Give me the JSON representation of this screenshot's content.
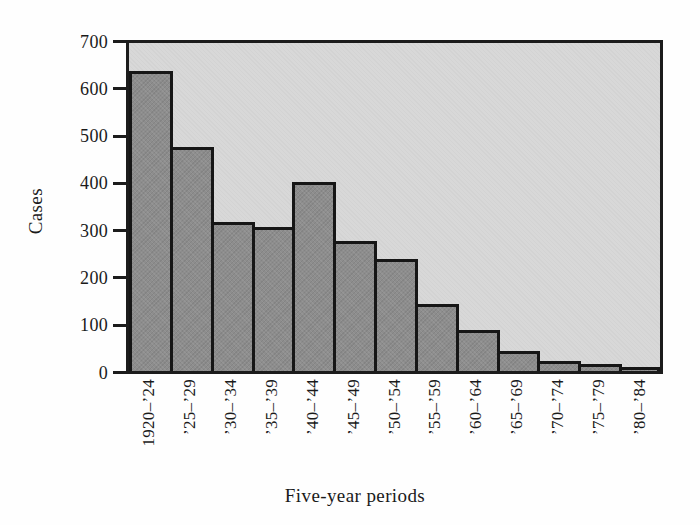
{
  "figure": {
    "y_axis_title": "Cases",
    "x_axis_title": "Five-year periods"
  },
  "chart_data": {
    "type": "bar",
    "title": "",
    "xlabel": "Five-year periods",
    "ylabel": "Cases",
    "categories": [
      "1920–’24",
      "’25–’29",
      "’30–’34",
      "’35–’39",
      "’40–’44",
      "’45–’49",
      "’50–’54",
      "’55–’59",
      "’60–’64",
      "’65–’69",
      "’70–’74",
      "’75–’79",
      "’80–’84"
    ],
    "values": [
      640,
      478,
      318,
      307,
      404,
      277,
      240,
      143,
      87,
      42,
      21,
      15,
      9
    ],
    "ylim": [
      0,
      700
    ],
    "yticks": [
      0,
      100,
      200,
      300,
      400,
      500,
      600,
      700
    ],
    "grid": false,
    "legend": null,
    "bar_outline": true,
    "colors": {
      "bar_fill": "#8d8d8d",
      "bar_border": "#161616",
      "plot_background": "#d8d8d8",
      "frame": "#1c1c1c",
      "page_background": "#fefefe",
      "text": "#1a1a1a"
    }
  }
}
